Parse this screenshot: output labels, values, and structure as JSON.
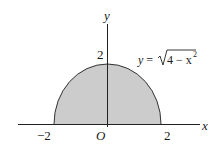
{
  "diagram": {
    "type": "semicircle-region",
    "axes": {
      "x_label": "x",
      "y_label": "y",
      "origin_label": "O",
      "x_ticks": [
        "−2",
        "2"
      ],
      "y_ticks": [
        "2"
      ]
    },
    "curve": {
      "equation_lhs": "y = ",
      "radicand": "4 − x",
      "exponent": "2"
    },
    "colors": {
      "fill": "#cccccc",
      "stroke": "#333333",
      "axis": "#222222"
    }
  }
}
